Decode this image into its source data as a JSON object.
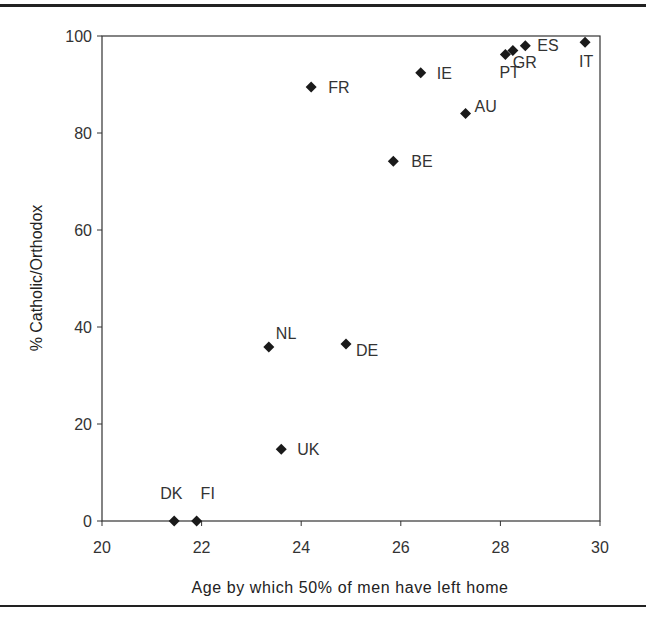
{
  "chart_data": {
    "type": "scatter",
    "title": "",
    "xlabel": "Age by which 50% of men have left home",
    "ylabel": "% Catholic/Orthodox",
    "xlim": [
      20,
      30
    ],
    "ylim": [
      0,
      100
    ],
    "xticks": [
      20,
      22,
      24,
      26,
      28,
      30
    ],
    "yticks": [
      0,
      20,
      40,
      60,
      80,
      100
    ],
    "grid": false,
    "legend": null,
    "marker": "diamond",
    "marker_color": "#1a1a1a",
    "points": [
      {
        "label": "DK",
        "x": 21.45,
        "y": 0,
        "lx": -14,
        "ly": -22
      },
      {
        "label": "FI",
        "x": 21.9,
        "y": 0,
        "lx": 4,
        "ly": -22
      },
      {
        "label": "NL",
        "x": 23.35,
        "y": 35.9,
        "lx": 7,
        "ly": -8
      },
      {
        "label": "UK",
        "x": 23.6,
        "y": 14.8,
        "lx": 16,
        "ly": 6
      },
      {
        "label": "FR",
        "x": 24.2,
        "y": 89.5,
        "lx": 17,
        "ly": 6
      },
      {
        "label": "DE",
        "x": 24.9,
        "y": 36.5,
        "lx": 10,
        "ly": 12
      },
      {
        "label": "BE",
        "x": 25.85,
        "y": 74.2,
        "lx": 18,
        "ly": 6
      },
      {
        "label": "IE",
        "x": 26.4,
        "y": 92.4,
        "lx": 16,
        "ly": 6
      },
      {
        "label": "AU",
        "x": 27.3,
        "y": 84.0,
        "lx": 9,
        "ly": -2
      },
      {
        "label": "PT",
        "x": 28.1,
        "y": 96.2,
        "lx": -6,
        "ly": 24
      },
      {
        "label": "GR",
        "x": 28.25,
        "y": 97.0,
        "lx": 0,
        "ly": 17
      },
      {
        "label": "ES",
        "x": 28.5,
        "y": 98.0,
        "lx": 12,
        "ly": 5
      },
      {
        "label": "IT",
        "x": 29.7,
        "y": 98.7,
        "lx": -6,
        "ly": 25
      }
    ]
  }
}
